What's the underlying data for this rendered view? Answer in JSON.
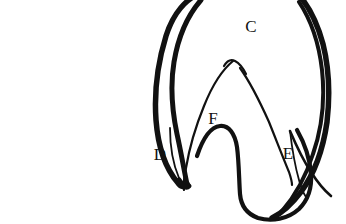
{
  "figure": {
    "caption": "Shape 7",
    "background_color": "#ffffff",
    "ink_color": "#111111",
    "labels": [
      {
        "id": "C",
        "text": "C",
        "x": 251,
        "y": 32,
        "region": "upper-outer-region"
      },
      {
        "id": "F",
        "text": "F",
        "x": 213,
        "y": 124,
        "region": "central-lobe-region"
      },
      {
        "id": "D",
        "text": "D",
        "x": 160,
        "y": 160,
        "region": "left-cusp-region"
      },
      {
        "id": "E",
        "text": "E",
        "x": 288,
        "y": 159,
        "region": "right-cusp-region"
      }
    ],
    "outlines": {
      "outer_contour": "M 196 -6 C 178 2 166 22 161 46 C 155 74 152 104 155 130 C 158 156 167 174 180 186 C 183 189 186 189 188 186 C 191 182 192 176 193 170 C 196 152 199 134 203 120 C 207 104 212 90 218 78 C 206 96 197 118 192 140 C 189 154 187 168 186 180 C 181 170 176 156 173 140 C 169 118 169 94 173 72 C 177 48 186 26 199 10 Z",
      "outer_right": "M 299 -6 C 309 6 317 24 322 46 C 327 70 328 96 325 120 C 322 146 314 170 302 188 C 294 200 285 210 276 216 C 290 212 303 200 313 184 C 324 166 331 142 333 116 C 335 88 331 58 320 32 C 315 18 308 6 299 -6 Z",
      "inner_contour": "M 232 60 C 222 72 212 90 204 110 C 196 130 190 150 186 168 C 184 178 183 186 183 190 C 188 180 194 164 200 148 C 208 126 218 102 229 84 C 236 72 241 64 232 60 Z",
      "inner_v_right": "M 234 61 C 244 74 255 94 264 114 C 273 134 281 152 287 166 C 290 173 292 179 293 183 C 289 172 283 156 276 140 C 266 116 254 90 242 72 C 237 64 232 60 234 61 Z",
      "central_lobe": "M 200 150 C 206 134 214 124 222 123 C 230 122 236 131 238 144 C 240 158 240 176 240 192 C 240 204 244 212 254 216 C 266 220 282 218 294 210 C 304 203 308 192 308 178 C 308 162 303 146 296 132"
    },
    "strokes": {
      "outer_width": 5.5,
      "inner_width": 2.0,
      "style": "hand-drawn-ink"
    }
  }
}
